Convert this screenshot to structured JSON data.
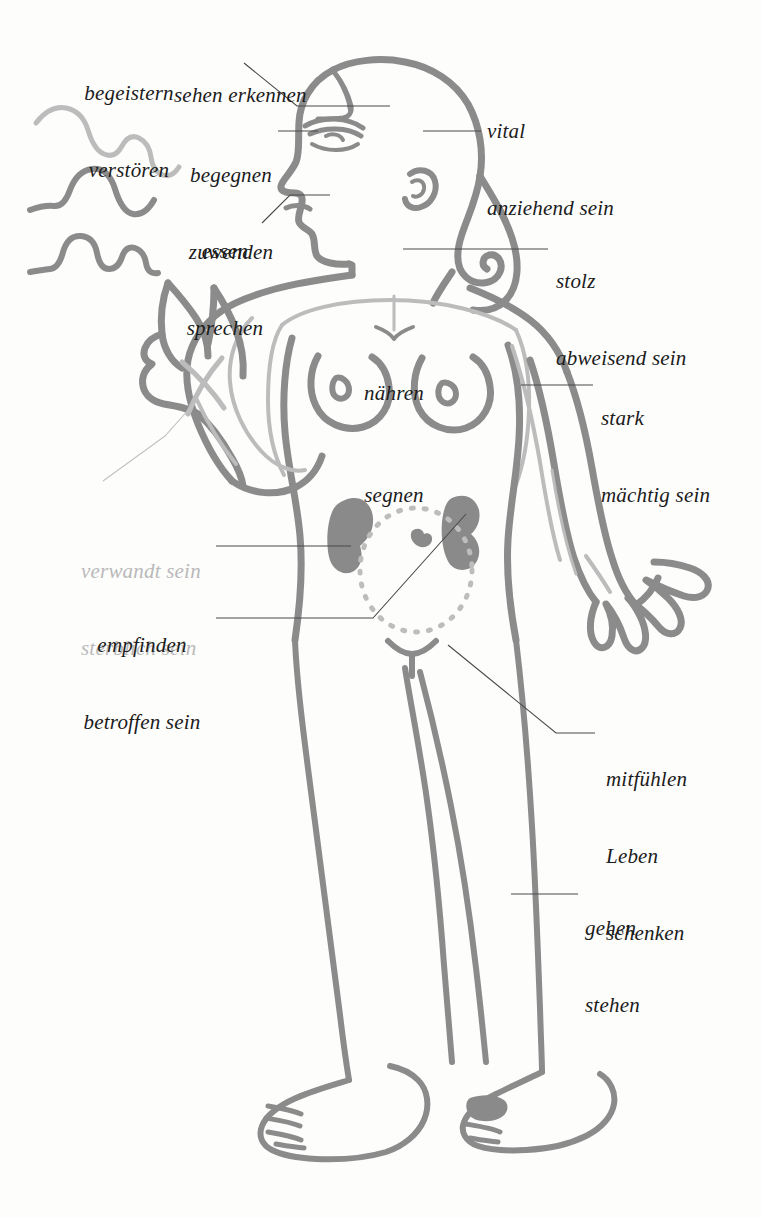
{
  "figure": {
    "stroke_color": "#8b8b8b",
    "stroke_color_light": "#bcbcbc",
    "organ_fill": "#8a8a8a",
    "label_color": "#1b1b1b",
    "label_color_muted": "#b9b9b9",
    "leader_color": "#4a4a4a",
    "background": "#fdfdfc"
  },
  "labels": [
    {
      "id": "begeistern",
      "lines": [
        "begeistern",
        "verstören"
      ],
      "tone": "dark",
      "align": "center"
    },
    {
      "id": "sehen",
      "lines": [
        "sehen erkennen"
      ],
      "tone": "dark",
      "align": "left"
    },
    {
      "id": "begegnen",
      "lines": [
        "begegnen",
        "zuwenden"
      ],
      "tone": "dark",
      "align": "center"
    },
    {
      "id": "essen",
      "lines": [
        "essen",
        "sprechen"
      ],
      "tone": "dark",
      "align": "center"
    },
    {
      "id": "vital",
      "lines": [
        "vital",
        "anziehend sein"
      ],
      "tone": "dark",
      "align": "left"
    },
    {
      "id": "stolz",
      "lines": [
        "stolz",
        "abweisend sein"
      ],
      "tone": "dark",
      "align": "left"
    },
    {
      "id": "stark",
      "lines": [
        "stark",
        "mächtig sein"
      ],
      "tone": "dark",
      "align": "left"
    },
    {
      "id": "naehren",
      "lines": [
        "nähren"
      ],
      "tone": "dark",
      "align": "center"
    },
    {
      "id": "segnen",
      "lines": [
        "segnen"
      ],
      "tone": "dark",
      "align": "center"
    },
    {
      "id": "verwandt",
      "lines": [
        "verwandt sein",
        "sterblich sein"
      ],
      "tone": "muted",
      "align": "left"
    },
    {
      "id": "empfinden",
      "lines": [
        "empfinden",
        "betroffen sein"
      ],
      "tone": "dark",
      "align": "center"
    },
    {
      "id": "mitfuehlen",
      "lines": [
        "mitfühlen",
        "Leben",
        "schenken"
      ],
      "tone": "dark",
      "align": "left"
    },
    {
      "id": "gehen",
      "lines": [
        "gehen",
        "stehen"
      ],
      "tone": "dark",
      "align": "left"
    }
  ],
  "text": {
    "begeistern_l1": "begeistern",
    "begeistern_l2": "verstören",
    "sehen_l1": "sehen erkennen",
    "begegnen_l1": "begegnen",
    "begegnen_l2": "zuwenden",
    "essen_l1": "essen",
    "essen_l2": "sprechen",
    "vital_l1": "vital",
    "vital_l2": "anziehend sein",
    "stolz_l1": "stolz",
    "stolz_l2": "abweisend sein",
    "stark_l1": "stark",
    "stark_l2": "mächtig sein",
    "naehren_l1": "nähren",
    "segnen_l1": "segnen",
    "verwandt_l1": "verwandt sein",
    "verwandt_l2": "sterblich sein",
    "empfinden_l1": "empfinden",
    "empfinden_l2": "betroffen sein",
    "mitfuehlen_l1": "mitfühlen",
    "mitfuehlen_l2": "Leben",
    "mitfuehlen_l3": "schenken",
    "gehen_l1": "gehen",
    "gehen_l2": "stehen"
  },
  "anatomy_parts": [
    {
      "name": "head-profile",
      "note": "Kopf im Profil nach links"
    },
    {
      "name": "hair",
      "note": "gewelltes Haar mit Locke"
    },
    {
      "name": "left-hand-raised",
      "note": "erhobene Hand mit Kreuzzeichen"
    },
    {
      "name": "right-hand-open",
      "note": "offene Hand mit gespreizten Fingern"
    },
    {
      "name": "breasts",
      "note": "Brüste"
    },
    {
      "name": "kidney-left",
      "note": "Niere links"
    },
    {
      "name": "kidney-right",
      "note": "Niere rechts"
    },
    {
      "name": "uterus-circle",
      "note": "gepunkteter Kreis, Gebärmutter"
    },
    {
      "name": "legs",
      "note": "Beine"
    },
    {
      "name": "feet",
      "note": "Füße"
    },
    {
      "name": "aura-waves",
      "note": "drei Wellenlinien links"
    },
    {
      "name": "sternum-axis",
      "note": "vertikale Mittelachse"
    }
  ]
}
